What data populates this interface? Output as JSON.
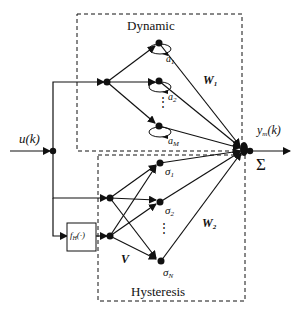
{
  "diagram": {
    "type": "neural-network-block-diagram",
    "colors": {
      "stroke": "#111111",
      "background": "#ffffff"
    },
    "blocks": {
      "dynamic": {
        "label": "Dynamic",
        "weights_label": "W",
        "weights_sub": "1"
      },
      "hysteresis": {
        "label": "Hysteresis",
        "weights_label": "W",
        "weights_sub": "2",
        "input_weights_label": "V"
      }
    },
    "input": {
      "label": "u(k)"
    },
    "output": {
      "label_main": "y",
      "label_sub": "m",
      "label_tail": "(k)",
      "sum_symbol": "Σ"
    },
    "operator_box": {
      "label_main": "f",
      "label_sub": "H",
      "label_tail": "(·)"
    },
    "dynamic_neurons": [
      {
        "name": "a",
        "sub": "1"
      },
      {
        "name": "a",
        "sub": "2"
      },
      {
        "name": "a",
        "sub": "M"
      }
    ],
    "hysteresis_neurons": [
      {
        "name": "σ",
        "sub": "1"
      },
      {
        "name": "σ",
        "sub": "2"
      },
      {
        "name": "σ",
        "sub": "N"
      }
    ],
    "ellipsis": "⋮"
  }
}
